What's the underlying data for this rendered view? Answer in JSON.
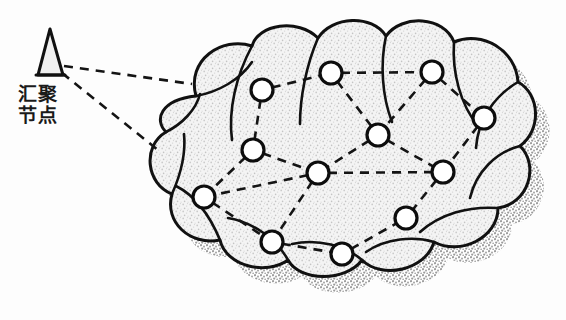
{
  "figure": {
    "background_color": "#fdfdfd"
  },
  "sink": {
    "icon_name": "antenna-triangle-icon",
    "label_line1": "汇聚",
    "label_line2": "节点",
    "label_full": "汇聚节点",
    "stroke_color": "#111111",
    "fill_color": "#f0f0f0",
    "apex": {
      "x": 50,
      "y": 29
    },
    "base_left": {
      "x": 38,
      "y": 75
    },
    "base_right": {
      "x": 63,
      "y": 75
    }
  },
  "cloud": {
    "name": "network-cloud",
    "stroke_color": "#111111",
    "fill_color": "#ededed",
    "shadow_color": "#b9b9b9",
    "stroke_width": 3,
    "bounds": {
      "x": 150,
      "y": 24,
      "width": 385,
      "height": 258
    }
  },
  "links_from_sink": [
    {
      "from": "sink",
      "to": "node-1",
      "x1": 64,
      "y1": 66,
      "x2": 192,
      "y2": 84
    },
    {
      "from": "sink",
      "to": "node-5",
      "x1": 62,
      "y1": 73,
      "x2": 158,
      "y2": 150
    }
  ],
  "nodes": [
    {
      "id": "node-1",
      "label": "",
      "x": 262,
      "y": 90,
      "r": 11
    },
    {
      "id": "node-2",
      "label": "",
      "x": 331,
      "y": 73,
      "r": 11
    },
    {
      "id": "node-3",
      "label": "",
      "x": 432,
      "y": 72,
      "r": 11
    },
    {
      "id": "node-4",
      "label": "",
      "x": 484,
      "y": 118,
      "r": 11
    },
    {
      "id": "node-5",
      "label": "",
      "x": 253,
      "y": 150,
      "r": 11
    },
    {
      "id": "node-6",
      "label": "",
      "x": 378,
      "y": 135,
      "r": 11
    },
    {
      "id": "node-7",
      "label": "",
      "x": 318,
      "y": 173,
      "r": 11
    },
    {
      "id": "node-8",
      "label": "",
      "x": 443,
      "y": 172,
      "r": 11
    },
    {
      "id": "node-9",
      "label": "",
      "x": 204,
      "y": 197,
      "r": 11
    },
    {
      "id": "node-10",
      "label": "",
      "x": 272,
      "y": 242,
      "r": 11
    },
    {
      "id": "node-11",
      "label": "",
      "x": 342,
      "y": 254,
      "r": 11
    },
    {
      "id": "node-12",
      "label": "",
      "x": 406,
      "y": 218,
      "r": 11
    }
  ],
  "edges": [
    {
      "from": "node-1",
      "to": "node-2"
    },
    {
      "from": "node-2",
      "to": "node-3"
    },
    {
      "from": "node-3",
      "to": "node-4"
    },
    {
      "from": "node-2",
      "to": "node-6"
    },
    {
      "from": "node-3",
      "to": "node-6"
    },
    {
      "from": "node-4",
      "to": "node-8"
    },
    {
      "from": "node-1",
      "to": "node-5"
    },
    {
      "from": "node-5",
      "to": "node-7"
    },
    {
      "from": "node-6",
      "to": "node-7"
    },
    {
      "from": "node-6",
      "to": "node-8"
    },
    {
      "from": "node-5",
      "to": "node-9"
    },
    {
      "from": "node-7",
      "to": "node-9"
    },
    {
      "from": "node-7",
      "to": "node-10"
    },
    {
      "from": "node-7",
      "to": "node-8"
    },
    {
      "from": "node-8",
      "to": "node-12"
    },
    {
      "from": "node-9",
      "to": "node-10"
    },
    {
      "from": "node-10",
      "to": "node-11"
    },
    {
      "from": "node-11",
      "to": "node-12"
    }
  ],
  "edge_style": {
    "stroke_color": "#141414",
    "stroke_width": 2.6,
    "dash_pattern": "9 7"
  },
  "node_style": {
    "stroke_color": "#0d0d0d",
    "fill_color": "#ffffff",
    "stroke_width": 3.2
  }
}
